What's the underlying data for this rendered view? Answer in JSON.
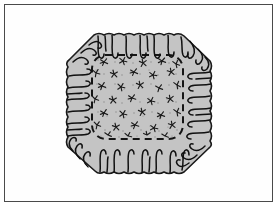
{
  "figure": {
    "title": "Gathered ruffled octagonal cushion cover",
    "caption": "",
    "frame": {
      "visible": true,
      "border_color": "#4a4a4a",
      "background_color": "#fefefe",
      "inset_px": 4,
      "border_width_px": 1
    },
    "page_background": "#ffffff"
  },
  "colors": {
    "fabric_fill": "#c4c4c4",
    "outline": "#1a1a1a",
    "gather_line": "#111111",
    "seam_dash": "#151515",
    "print_motif": "#1c1c1c",
    "speckle": "#8c8c8c",
    "frame_border": "#4a4a4a",
    "paper": "#fefefe"
  },
  "shape": {
    "name": "octagon",
    "center_x": 139,
    "center_y": 104,
    "half_width": 72,
    "half_height": 69,
    "corner_cut": 26,
    "outline_style": "wavy-scalloped",
    "fill": "#c4c4c4",
    "stroke_width": 1.6
  },
  "seam": {
    "name": "inner-seam-line",
    "style": "dashed",
    "left": 92,
    "top": 55,
    "right": 183,
    "bottom": 139,
    "corner_radius": 14,
    "dash_pattern": "7 5",
    "stroke_width": 2.0,
    "color": "#151515"
  },
  "ruffle": {
    "description": "gather lines radiating inward from the scalloped edge",
    "segments": [
      {
        "edge": "top",
        "count": 9
      },
      {
        "edge": "right",
        "count": 8
      },
      {
        "edge": "bottom",
        "count": 9
      },
      {
        "edge": "left",
        "count": 8
      },
      {
        "edge": "corner-top-left",
        "count": 3
      },
      {
        "edge": "corner-top-right",
        "count": 3
      },
      {
        "edge": "corner-bottom-right",
        "count": 3
      },
      {
        "edge": "corner-bottom-left",
        "count": 3
      }
    ],
    "total_gathers": 46,
    "stroke_width": 1.5,
    "color": "#111111"
  },
  "print": {
    "name": "floral-scatter-print",
    "motif": "small-asterisk-flower",
    "motif_count": 54,
    "speckle_count": 210,
    "region": "inside-seam-square",
    "color": "#1c1c1c"
  }
}
